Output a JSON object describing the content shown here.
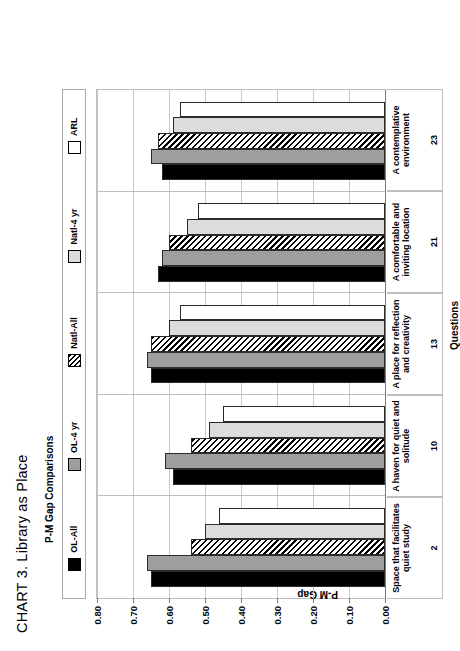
{
  "figure": {
    "title": "CHART 3. Library as Place",
    "subtitle": "P-M Gap Comparisons"
  },
  "legend": {
    "position": "top",
    "items": [
      {
        "label": "OL-All",
        "swatch": "solid-black-swatch",
        "color": "#000000"
      },
      {
        "label": "OL-4 yr",
        "swatch": "solid-gray-swatch",
        "color": "#9e9e9e"
      },
      {
        "label": "Natl-All",
        "swatch": "hatched-swatch",
        "color": "#000000"
      },
      {
        "label": "Natl-4 yr",
        "swatch": "light-gray-swatch",
        "color": "#dcdcdc"
      },
      {
        "label": "ARL",
        "swatch": "white-swatch",
        "color": "#ffffff"
      }
    ]
  },
  "axes": {
    "ylabel": "P-M Gap",
    "xlabel": "Questions",
    "yticks": [
      "0.80",
      "0.70",
      "0.60",
      "0.50",
      "0.40",
      "0.30",
      "0.20",
      "0.10",
      "0.00"
    ]
  },
  "chart_data": {
    "type": "bar",
    "title": "CHART 3. Library as Place",
    "subtitle": "P-M Gap Comparisons",
    "xlabel": "Questions",
    "ylabel": "P-M Gap",
    "ylim": [
      0.0,
      0.8
    ],
    "ytick_values": [
      0.0,
      0.1,
      0.2,
      0.3,
      0.4,
      0.5,
      0.6,
      0.7,
      0.8
    ],
    "grid": true,
    "legend_position": "top",
    "orientation": "vertical-bars-rendered-sideways",
    "categories": [
      "Space that facilitates quiet study",
      "A haven for quiet and solitude",
      "A place for reflection and creativity",
      "A comfortable and inviting location",
      "A contemplative environment"
    ],
    "category_numbers": [
      "2",
      "10",
      "13",
      "21",
      "23"
    ],
    "series": [
      {
        "name": "OL-All",
        "values": [
          0.65,
          0.59,
          0.65,
          0.63,
          0.62
        ]
      },
      {
        "name": "OL-4 yr",
        "values": [
          0.66,
          0.61,
          0.66,
          0.62,
          0.65
        ]
      },
      {
        "name": "Natl-All",
        "values": [
          0.54,
          0.54,
          0.65,
          0.6,
          0.63
        ]
      },
      {
        "name": "Natl-4 yr",
        "values": [
          0.5,
          0.49,
          0.6,
          0.55,
          0.59
        ]
      },
      {
        "name": "ARL",
        "values": [
          0.46,
          0.45,
          0.57,
          0.52,
          0.57
        ]
      }
    ]
  }
}
